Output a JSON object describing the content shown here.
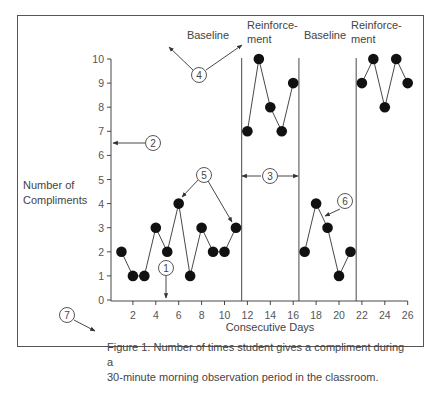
{
  "chart_data": {
    "type": "line",
    "title": "",
    "xlabel": "Consecutive Days",
    "ylabel": "Number of Compliments",
    "ylabel_lines": [
      "Number of",
      "Compliments"
    ],
    "xlim": [
      0,
      26
    ],
    "ylim": [
      0,
      10
    ],
    "x_ticks": [
      2,
      4,
      6,
      8,
      10,
      12,
      14,
      16,
      18,
      20,
      22,
      24,
      26
    ],
    "y_ticks": [
      0,
      1,
      2,
      3,
      4,
      5,
      6,
      7,
      8,
      9,
      10
    ],
    "grid": false,
    "phase_lines_after_day": [
      11.5,
      16.5,
      21.5
    ],
    "series": [
      {
        "name": "Baseline",
        "x": [
          1,
          2,
          3,
          4,
          5,
          6,
          7,
          8,
          9,
          10,
          11
        ],
        "values": [
          2,
          1,
          1,
          3,
          2,
          4,
          1,
          3,
          2,
          2,
          3
        ]
      },
      {
        "name": "Reinforcement",
        "x": [
          12,
          13,
          14,
          15,
          16
        ],
        "values": [
          7,
          10,
          8,
          7,
          9
        ]
      },
      {
        "name": "Baseline",
        "x": [
          17,
          18,
          19,
          20,
          21
        ],
        "values": [
          2,
          4,
          3,
          1,
          2
        ]
      },
      {
        "name": "Reinforcement",
        "x": [
          22,
          23,
          24,
          25,
          26
        ],
        "values": [
          9,
          10,
          8,
          10,
          9
        ]
      }
    ],
    "phase_labels": [
      {
        "lines": [
          "Baseline"
        ]
      },
      {
        "lines": [
          "Reinforce-",
          "ment"
        ]
      },
      {
        "lines": [
          "Baseline"
        ]
      },
      {
        "lines": [
          "Reinforce-",
          "ment"
        ]
      }
    ],
    "annotations": [
      {
        "number": "1",
        "points_to": "x-axis"
      },
      {
        "number": "2",
        "points_to": "y-axis"
      },
      {
        "number": "3",
        "points_to": "phase width"
      },
      {
        "number": "4",
        "points_to": "phase labels"
      },
      {
        "number": "5",
        "points_to": "data points"
      },
      {
        "number": "6",
        "points_to": "data path"
      },
      {
        "number": "7",
        "points_to": "figure caption"
      }
    ],
    "caption": "Figure 1. Number of times student gives a compliment during a 30-minute morning observation period in the classroom."
  },
  "caption_lines": [
    "Figure 1. Number of times student gives a compliment during a",
    "30-minute morning observation period in the classroom."
  ]
}
